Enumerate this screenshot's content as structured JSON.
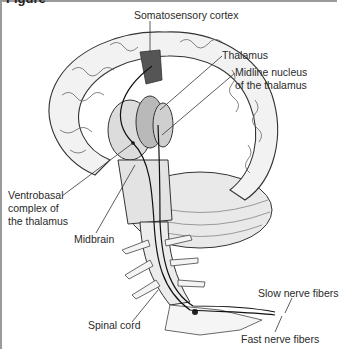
{
  "figure": {
    "title_fragment": "Figure",
    "labels": {
      "somatosensory_cortex": "Somatosensory cortex",
      "thalamus": "Thalamus",
      "midline_nucleus_line1": "Midline nucleus",
      "midline_nucleus_line2": "of the thalamus",
      "ventrobasal_line1": "Ventrobasal",
      "ventrobasal_line2": "complex of",
      "ventrobasal_line3": "the thalamus",
      "midbrain": "Midbrain",
      "spinal_cord": "Spinal cord",
      "slow_nerve_fibers": "Slow nerve fibers",
      "fast_nerve_fibers": "Fast nerve fibers"
    }
  },
  "colors": {
    "frame": "#9a9a9a",
    "ink": "#2a2a2a",
    "brain_fill": "#f1f1f1",
    "shade": "#cfcfcf",
    "dark_shade": "#555555"
  }
}
